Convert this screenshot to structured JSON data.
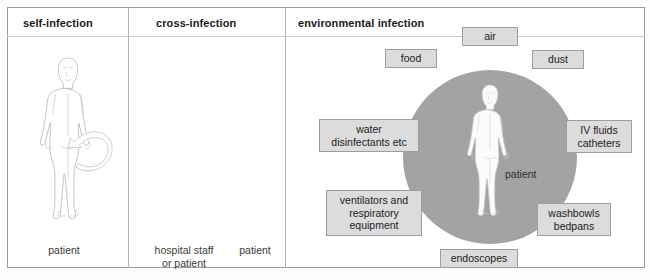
{
  "diagram": {
    "panels": [
      {
        "id": "self-infection",
        "title": "self-infection",
        "caption": "patient",
        "arrow": "self-loop-arrow"
      },
      {
        "id": "cross-infection",
        "title": "cross-infection",
        "caption_source": "hospital staff\nor patient",
        "caption_target": "patient",
        "arrow": "right-arrow"
      },
      {
        "id": "environmental-infection",
        "title": "environmental infection",
        "center_label": "patient",
        "sources": [
          {
            "label": "air",
            "angle": -90
          },
          {
            "label": "dust",
            "angle": -45
          },
          {
            "label": "IV fluids\ncatheters",
            "angle": 0
          },
          {
            "label": "washbowls\nbedpans",
            "angle": 45
          },
          {
            "label": "endoscopes",
            "angle": 90
          },
          {
            "label": "ventilators and\nrespiratory\nequipment",
            "angle": 135
          },
          {
            "label": "water\ndisinfectants etc",
            "angle": 180
          },
          {
            "label": "food",
            "angle": -135
          }
        ]
      }
    ],
    "colors": {
      "circle_fill": "#a3a3a3",
      "box_fill": "#dcdcdc",
      "box_border": "#9e9e9e",
      "frame_border": "#9a9a9a",
      "figure_stroke": "#b9b9b9",
      "connector_stroke": "#cfcfcf",
      "text": "#222222"
    }
  }
}
